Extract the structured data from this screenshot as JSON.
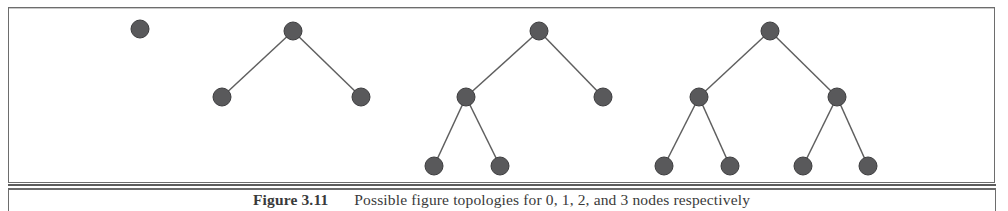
{
  "page": {
    "width": 1008,
    "height": 211,
    "background_color": "#ffffff",
    "frame_color": "#6d6d6d"
  },
  "figure": {
    "node_color": "#59595b",
    "node_outline_color": "#3d3d3f",
    "edge_color": "#5f5f5f",
    "node_radius": 9,
    "trees": [
      {
        "name": "tree-0-one-node",
        "node_count": 1,
        "nodes": [
          {
            "id": "t1-root",
            "x": 140,
            "y": 29
          }
        ],
        "edges": []
      },
      {
        "name": "tree-1-three-nodes",
        "node_count": 3,
        "nodes": [
          {
            "id": "t2-root",
            "x": 293,
            "y": 31
          },
          {
            "id": "t2-left",
            "x": 222,
            "y": 97
          },
          {
            "id": "t2-right",
            "x": 361,
            "y": 97
          }
        ],
        "edges": [
          {
            "from": "t2-root",
            "to": "t2-left"
          },
          {
            "from": "t2-root",
            "to": "t2-right"
          }
        ]
      },
      {
        "name": "tree-2-five-nodes",
        "node_count": 5,
        "nodes": [
          {
            "id": "t3-root",
            "x": 539,
            "y": 31
          },
          {
            "id": "t3-left",
            "x": 466,
            "y": 97
          },
          {
            "id": "t3-right",
            "x": 603,
            "y": 97
          },
          {
            "id": "t3-left-left",
            "x": 434,
            "y": 166
          },
          {
            "id": "t3-left-right",
            "x": 500,
            "y": 166
          }
        ],
        "edges": [
          {
            "from": "t3-root",
            "to": "t3-left"
          },
          {
            "from": "t3-root",
            "to": "t3-right"
          },
          {
            "from": "t3-left",
            "to": "t3-left-left"
          },
          {
            "from": "t3-left",
            "to": "t3-left-right"
          }
        ]
      },
      {
        "name": "tree-3-seven-nodes",
        "node_count": 7,
        "nodes": [
          {
            "id": "t4-root",
            "x": 770,
            "y": 31
          },
          {
            "id": "t4-left",
            "x": 699,
            "y": 97
          },
          {
            "id": "t4-right",
            "x": 837,
            "y": 97
          },
          {
            "id": "t4-left-left",
            "x": 664,
            "y": 166
          },
          {
            "id": "t4-left-right",
            "x": 730,
            "y": 166
          },
          {
            "id": "t4-right-left",
            "x": 803,
            "y": 166
          },
          {
            "id": "t4-right-right",
            "x": 868,
            "y": 166
          }
        ],
        "edges": [
          {
            "from": "t4-root",
            "to": "t4-left"
          },
          {
            "from": "t4-root",
            "to": "t4-right"
          },
          {
            "from": "t4-left",
            "to": "t4-left-left"
          },
          {
            "from": "t4-left",
            "to": "t4-left-right"
          },
          {
            "from": "t4-right",
            "to": "t4-right-left"
          },
          {
            "from": "t4-right",
            "to": "t4-right-right"
          }
        ]
      }
    ]
  },
  "caption": {
    "label": "Figure 3.11",
    "text": "Possible figure topologies for 0, 1, 2, and 3 nodes respectively"
  }
}
